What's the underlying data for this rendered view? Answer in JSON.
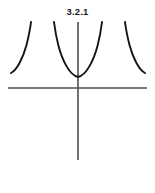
{
  "figure": {
    "label": "3.2.1",
    "stroke_color": "#141414",
    "axis_color": "#4d4d4d",
    "background_color": "#ffffff",
    "curve_width": 1.9,
    "axis_width": 1.6
  },
  "chart_data": {
    "type": "line",
    "title": "3.2.1",
    "xlabel": "",
    "ylabel": "",
    "grid": false,
    "legend": null,
    "axes": {
      "x_axis": {
        "y_pixel": 88,
        "x_start": 8,
        "x_end": 147
      },
      "y_axis": {
        "x_pixel": 78,
        "y_start": 22,
        "y_end": 160
      },
      "origin": {
        "x": 78,
        "y": 88
      }
    },
    "asymptotes_x": [
      31,
      54,
      102,
      125
    ],
    "series": [
      {
        "name": "branch-left-outer",
        "points": [
          [
            11,
            73
          ],
          [
            13,
            70
          ],
          [
            16,
            65
          ],
          [
            19,
            59
          ],
          [
            22,
            52
          ],
          [
            25,
            44
          ],
          [
            28,
            34
          ],
          [
            30,
            26
          ],
          [
            31,
            22
          ]
        ]
      },
      {
        "name": "branch-center-u",
        "points": [
          [
            54,
            22
          ],
          [
            55,
            30
          ],
          [
            57,
            40
          ],
          [
            60,
            50
          ],
          [
            64,
            60
          ],
          [
            69,
            69
          ],
          [
            74,
            75
          ],
          [
            78,
            77
          ],
          [
            82,
            75
          ],
          [
            87,
            69
          ],
          [
            92,
            60
          ],
          [
            96,
            50
          ],
          [
            99,
            40
          ],
          [
            101,
            30
          ],
          [
            102,
            22
          ]
        ]
      },
      {
        "name": "branch-right-outer",
        "points": [
          [
            125,
            22
          ],
          [
            126,
            26
          ],
          [
            128,
            34
          ],
          [
            131,
            44
          ],
          [
            134,
            52
          ],
          [
            137,
            59
          ],
          [
            140,
            65
          ],
          [
            143,
            70
          ],
          [
            145,
            73
          ]
        ]
      }
    ],
    "xlim": [
      0,
      155
    ],
    "ylim": [
      193,
      0
    ]
  }
}
